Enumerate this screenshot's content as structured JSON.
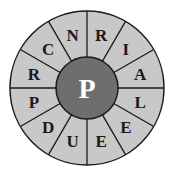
{
  "puzzle": {
    "center_letter": "P",
    "ring_letters_clockwise_from_top": [
      "R",
      "I",
      "A",
      "L",
      "E",
      "E",
      "U",
      "D",
      "P",
      "R",
      "C",
      "N"
    ],
    "colors": {
      "ring_fill": "#c8c8c8",
      "center_fill": "#6e6e6e",
      "line": "#1a1a1a",
      "ring_text": "#1a1a1a",
      "center_text": "#ffffff"
    }
  }
}
